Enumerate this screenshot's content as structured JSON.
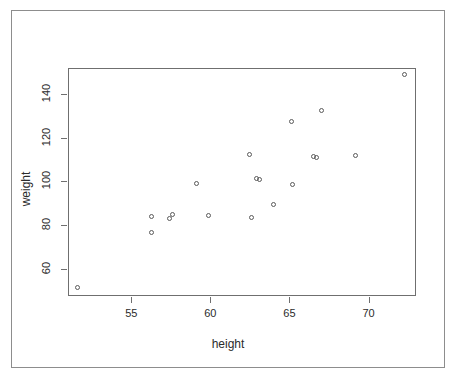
{
  "chart_data": {
    "type": "scatter",
    "title": "",
    "xlabel": "height",
    "ylabel": "weight",
    "xlim": [
      51.0,
      73.0
    ],
    "ylim": [
      47.5,
      152.0
    ],
    "xticks": [
      55,
      60,
      65,
      70
    ],
    "yticks": [
      60,
      80,
      100,
      120,
      140
    ],
    "xtick_labels": [
      "55",
      "60",
      "65",
      "70"
    ],
    "ytick_labels": [
      "60",
      "80",
      "100",
      "120",
      "140"
    ],
    "grid": false,
    "legend": null,
    "marker": "open-circle",
    "marker_color": "#5a5a5a",
    "n_points": 21,
    "points": [
      {
        "x": 51.6,
        "weight": 51.5
      },
      {
        "x": 56.3,
        "weight": 84.0
      },
      {
        "x": 56.3,
        "weight": 76.5
      },
      {
        "x": 57.4,
        "weight": 83.0
      },
      {
        "x": 57.6,
        "weight": 85.0
      },
      {
        "x": 59.1,
        "weight": 99.0
      },
      {
        "x": 59.9,
        "weight": 84.5
      },
      {
        "x": 62.5,
        "weight": 112.5
      },
      {
        "x": 62.9,
        "weight": 101.5
      },
      {
        "x": 63.1,
        "weight": 101.0
      },
      {
        "x": 62.6,
        "weight": 83.5
      },
      {
        "x": 64.0,
        "weight": 89.5
      },
      {
        "x": 65.1,
        "weight": 127.5
      },
      {
        "x": 65.2,
        "weight": 98.5
      },
      {
        "x": 66.5,
        "weight": 111.5
      },
      {
        "x": 66.7,
        "weight": 111.0
      },
      {
        "x": 67.0,
        "weight": 132.5
      },
      {
        "x": 69.2,
        "weight": 112.0
      },
      {
        "x": 72.3,
        "weight": 149.0
      }
    ],
    "series": [
      {
        "name": "height vs weight",
        "x": [
          51.6,
          56.3,
          56.3,
          57.4,
          57.6,
          59.1,
          59.9,
          62.5,
          62.6,
          62.9,
          63.1,
          64.0,
          65.1,
          65.2,
          66.5,
          66.7,
          67.0,
          69.2,
          72.3
        ],
        "y": [
          51.5,
          84.0,
          76.5,
          83.0,
          85.0,
          99.0,
          84.5,
          112.5,
          83.5,
          101.5,
          101.0,
          89.5,
          127.5,
          98.5,
          111.5,
          111.0,
          132.5,
          112.0,
          149.0
        ]
      }
    ]
  },
  "figure": {
    "background": "#ffffff",
    "frame_color": "#8d8d8d",
    "axis_color": "#6f6f6f",
    "text_color": "#2b2b2b"
  }
}
